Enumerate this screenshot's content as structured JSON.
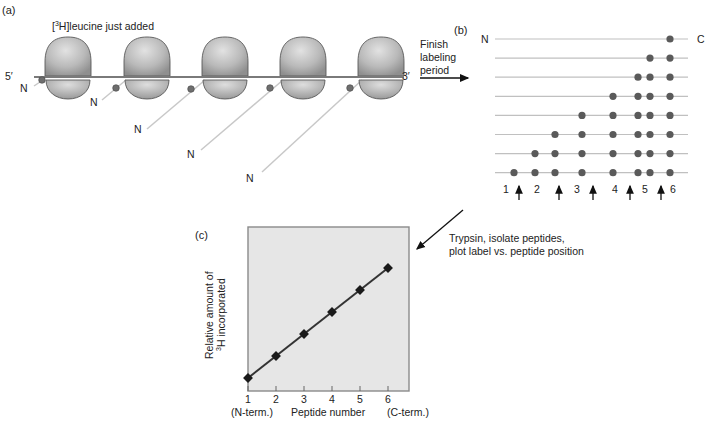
{
  "panels": {
    "a": {
      "label": "(a)",
      "title_prefix": "[",
      "title_sup": "3",
      "title_suffix": "H]leucine just added",
      "mrna_5prime": "5′",
      "mrna_3prime": "3′",
      "n_terminus_label": "N",
      "ribosome_count": 5,
      "ribosome_centers_x": [
        68,
        147,
        225,
        303,
        381
      ],
      "colors": {
        "ribosome": "#b8b8b8",
        "mrna": "#7a7a7a",
        "chain": "#c8c8c8",
        "label_dot": "#6e6e6e"
      }
    },
    "arrow_ab": {
      "text_lines": [
        "Finish",
        "labeling",
        "period"
      ]
    },
    "b": {
      "label": "(b)",
      "n_label": "N",
      "c_label": "C",
      "rows": [
        [
          670
        ],
        [
          650,
          670
        ],
        [
          638,
          650,
          670
        ],
        [
          613,
          638,
          650,
          670
        ],
        [
          582,
          613,
          638,
          650,
          670
        ],
        [
          555,
          582,
          613,
          638,
          650,
          670
        ],
        [
          535,
          555,
          582,
          613,
          638,
          650,
          670
        ],
        [
          514,
          535,
          555,
          582,
          613,
          638,
          650,
          670
        ]
      ],
      "peptide_numbers": [
        "1",
        "2",
        "3",
        "4",
        "5",
        "6"
      ],
      "cleavage_arrow_count": 5,
      "colors": {
        "dot": "#5a5a5a",
        "line": "#c0c0c0"
      }
    },
    "arrow_bc": {
      "text_lines": [
        "Trypsin, isolate peptides,",
        "plot label vs. peptide position"
      ]
    },
    "c": {
      "label": "(c)",
      "ylabel_line1": "Relative amount of",
      "ylabel_line2_sup": "3",
      "ylabel_line2_rest": "H incorporated",
      "xlabel": "Peptide number",
      "x_left_note": "(N-term.)",
      "x_right_note": "(C-term.)",
      "colors": {
        "plot_bg": "#e6e6e6",
        "frame": "#8a8a8a",
        "line": "#333333"
      }
    }
  },
  "chart_data": {
    "type": "line",
    "title": "",
    "xlabel": "Peptide number",
    "ylabel": "Relative amount of 3H incorporated",
    "x": [
      1,
      2,
      3,
      4,
      5,
      6
    ],
    "categories": [
      "1",
      "2",
      "3",
      "4",
      "5",
      "6"
    ],
    "series": [
      {
        "name": "3H label",
        "values": [
          0,
          1,
          2,
          3,
          4,
          5
        ]
      }
    ],
    "x_annotations": {
      "left": "(N-term.)",
      "right": "(C-term.)"
    },
    "grid": false,
    "legend": "none",
    "yticks": "none"
  }
}
